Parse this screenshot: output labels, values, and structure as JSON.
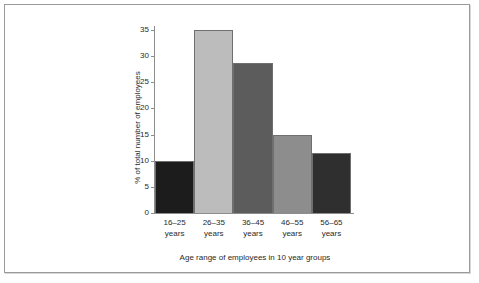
{
  "chart_data": {
    "type": "bar",
    "title": "",
    "xlabel": "Age range of employees in 10 year groups",
    "ylabel": "% of total number of employees",
    "categories": [
      "16–25 years",
      "26–35 years",
      "36–45 years",
      "46–55 years",
      "56–65 years"
    ],
    "category_lines": [
      {
        "line1": "16–25",
        "line2": "years"
      },
      {
        "line1": "26–35",
        "line2": "years"
      },
      {
        "line1": "36–45",
        "line2": "years"
      },
      {
        "line1": "46–55",
        "line2": "years"
      },
      {
        "line1": "56–65",
        "line2": "years"
      }
    ],
    "values": [
      10,
      35,
      28.7,
      15,
      11.4
    ],
    "bar_colors": [
      "#1c1c1c",
      "#bcbcbc",
      "#5c5c5c",
      "#8d8d8d",
      "#2f2f2f"
    ],
    "ylim": [
      0,
      35
    ],
    "yticks": [
      0,
      5,
      10,
      15,
      20,
      25,
      30,
      35
    ],
    "ytick_labels": [
      "0",
      "5",
      "10",
      "15",
      "20",
      "25",
      "30",
      "35"
    ],
    "grid": false,
    "legend": false,
    "bar_gap": 0
  }
}
